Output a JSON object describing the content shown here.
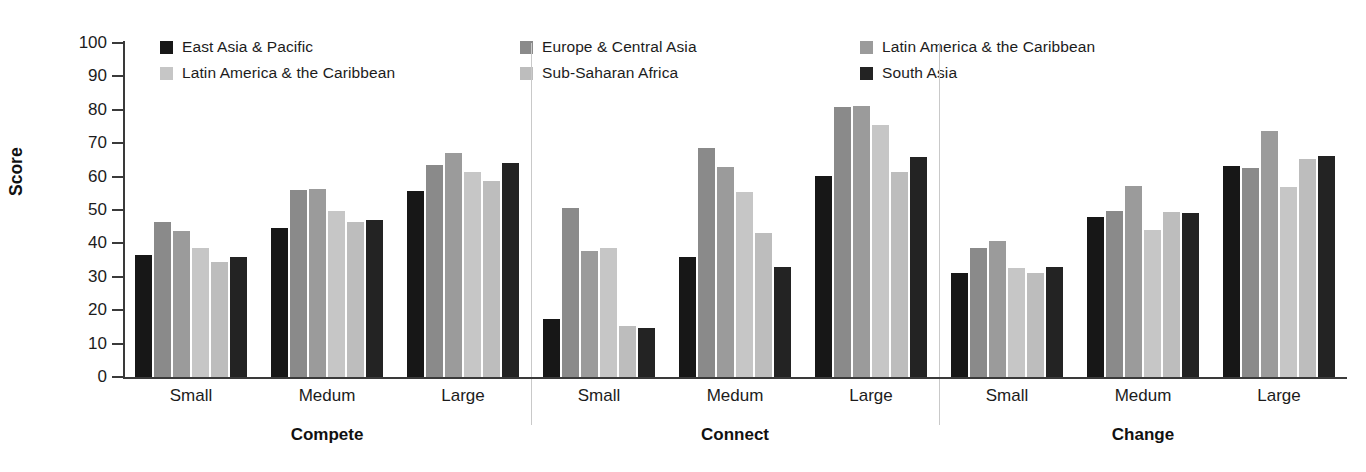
{
  "chart_data": {
    "type": "bar",
    "title": "",
    "xlabel": "",
    "ylabel": "Score",
    "ylim": [
      0,
      100
    ],
    "ytick_step": 10,
    "yticks": [
      100,
      90,
      80,
      70,
      60,
      50,
      40,
      30,
      20,
      10,
      0
    ],
    "grid": false,
    "legend_position": "top",
    "series": [
      {
        "name": "East Asia & Pacific",
        "color": "#171717"
      },
      {
        "name": "Europe & Central Asia",
        "color": "#8a8a8a"
      },
      {
        "name": "Latin America & the Caribbean",
        "color": "#9b9b9b"
      },
      {
        "name": "Latin America & the Caribbean",
        "color": "#c6c6c6"
      },
      {
        "name": "Sub-Saharan Africa",
        "color": "#bdbdbd"
      },
      {
        "name": "South Asia",
        "color": "#232323"
      }
    ],
    "sections": [
      {
        "name": "Compete",
        "groups": [
          {
            "category": "Small",
            "values": [
              36.5,
              46.3,
              43.6,
              38.5,
              34.3,
              36.0
            ]
          },
          {
            "category": "Medum",
            "values": [
              44.7,
              56.0,
              56.2,
              49.6,
              46.3,
              47.0
            ]
          },
          {
            "category": "Large",
            "values": [
              55.7,
              63.6,
              67.0,
              61.3,
              58.7,
              64.2
            ]
          }
        ]
      },
      {
        "name": "Connect",
        "groups": [
          {
            "category": "Small",
            "values": [
              17.3,
              50.6,
              37.8,
              38.6,
              15.2,
              14.8
            ]
          },
          {
            "category": "Medum",
            "values": [
              35.8,
              68.5,
              63.0,
              55.5,
              43.0,
              33.0
            ]
          },
          {
            "category": "Large",
            "values": [
              60.3,
              80.8,
              81.0,
              75.5,
              61.3,
              66.0
            ]
          }
        ]
      },
      {
        "name": "Change",
        "groups": [
          {
            "category": "Small",
            "values": [
              31.0,
              38.6,
              40.7,
              32.5,
              31.2,
              32.8
            ]
          },
          {
            "category": "Medum",
            "values": [
              47.9,
              49.6,
              57.2,
              44.0,
              49.5,
              49.2
            ]
          },
          {
            "category": "Large",
            "values": [
              63.3,
              62.6,
              73.7,
              57.0,
              65.2,
              66.2
            ]
          }
        ]
      }
    ],
    "legend_rows": [
      [
        "East Asia & Pacific",
        "Europe & Central Asia",
        "Latin America & the Caribbean"
      ],
      [
        "Latin America & the Caribbean",
        "Sub-Saharan Africa",
        "South Asia"
      ]
    ]
  },
  "axis": {
    "y_title": "Score"
  }
}
